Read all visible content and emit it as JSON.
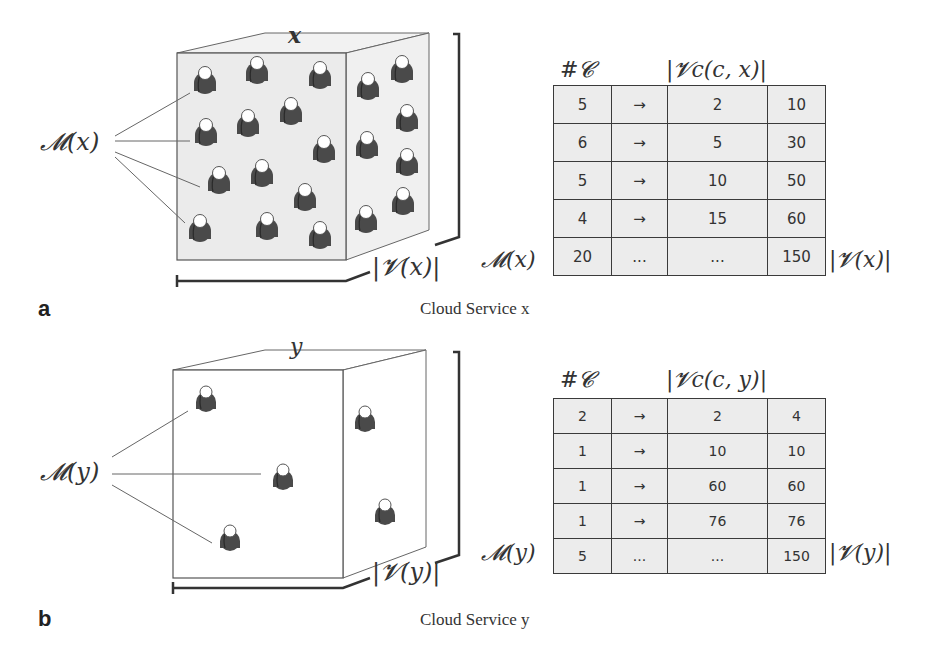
{
  "panels": {
    "a": {
      "letter": "a",
      "caption": "Cloud Service x",
      "cube_label": "x",
      "members_label": "𝓜(x)",
      "volume_label": "|𝓥(x)|",
      "header_count": "#𝓒",
      "header_volume": "|𝓥c(c, x)|",
      "row_label_left": "𝓜(x)",
      "row_label_right": "|𝓥(x)|",
      "rows": [
        {
          "count": "5",
          "arrow": "→",
          "per_member": "2",
          "total": "10"
        },
        {
          "count": "6",
          "arrow": "→",
          "per_member": "5",
          "total": "30"
        },
        {
          "count": "5",
          "arrow": "→",
          "per_member": "10",
          "total": "50"
        },
        {
          "count": "4",
          "arrow": "→",
          "per_member": "15",
          "total": "60"
        },
        {
          "count": "20",
          "arrow": "...",
          "per_member": "...",
          "total": "150"
        }
      ]
    },
    "b": {
      "letter": "b",
      "caption": "Cloud Service y",
      "cube_label": "y",
      "members_label": "𝓜(y)",
      "volume_label": "|𝓥(y)|",
      "header_count": "#𝓒",
      "header_volume": "|𝓥c(c, y)|",
      "row_label_left": "𝓜(y)",
      "row_label_right": "|𝓥(y)|",
      "rows": [
        {
          "count": "2",
          "arrow": "→",
          "per_member": "2",
          "total": "4"
        },
        {
          "count": "1",
          "arrow": "→",
          "per_member": "10",
          "total": "10"
        },
        {
          "count": "1",
          "arrow": "→",
          "per_member": "60",
          "total": "60"
        },
        {
          "count": "1",
          "arrow": "→",
          "per_member": "76",
          "total": "76"
        },
        {
          "count": "5",
          "arrow": "...",
          "per_member": "...",
          "total": "150"
        }
      ]
    }
  },
  "icons": {
    "member": "person-icon"
  },
  "colors": {
    "cube_fill": "#efefef",
    "cube_edge": "#555555",
    "person_body": "#4a4a4a",
    "person_head": "#ffffff",
    "table_cell": "#ececec"
  }
}
